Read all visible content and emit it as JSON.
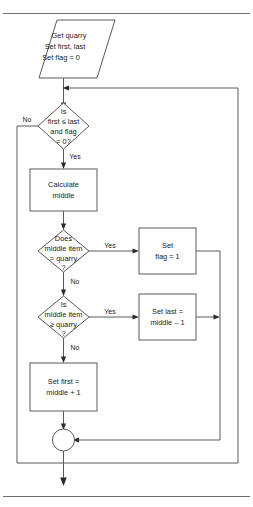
{
  "figure": {
    "border_color": "#6e6e6e",
    "shape_stroke": "#5a5a5a",
    "text_color": "#1a1a1a"
  },
  "nodes": [
    {
      "id": "start",
      "shape": "parallelogram",
      "lines": [
        "Get quarry",
        "Set first, last",
        "Set flag = 0"
      ]
    },
    {
      "id": "loop-test",
      "shape": "diamond",
      "lines": [
        "Is",
        "first ≤ last",
        "and flag",
        "= 0?"
      ]
    },
    {
      "id": "calc-middle",
      "shape": "rectangle",
      "lines": [
        "Calculate",
        "middle"
      ]
    },
    {
      "id": "equal-test",
      "shape": "diamond",
      "lines": [
        "Does",
        "middle item",
        "= quarry",
        "?"
      ]
    },
    {
      "id": "set-flag",
      "shape": "rectangle",
      "lines": [
        "Set",
        "flag = 1"
      ]
    },
    {
      "id": "ge-test",
      "shape": "diamond",
      "lines": [
        "Is",
        "middle item",
        "≥ quarry",
        "?"
      ]
    },
    {
      "id": "set-last",
      "shape": "rectangle",
      "lines": [
        "Set last =",
        "middle – 1"
      ]
    },
    {
      "id": "set-first",
      "shape": "rectangle",
      "lines": [
        "Set first =",
        "middle + 1"
      ]
    },
    {
      "id": "junction",
      "shape": "circle",
      "lines": []
    }
  ],
  "edge_labels": {
    "loop_test_no": "No",
    "loop_test_yes": "Yes",
    "equal_test_yes": "Yes",
    "equal_test_no": "No",
    "ge_test_yes": "Yes",
    "ge_test_no": "No"
  },
  "node_text": {
    "start": {
      "l1": "Get quarry",
      "l2": "Set first, last",
      "l3": "Set flag = 0"
    },
    "loop_test": {
      "l1": "Is",
      "l2": "first ≤ last",
      "l3": "and flag",
      "l4": "= 0?"
    },
    "calc_middle": {
      "l1": "Calculate",
      "l2": "middle"
    },
    "equal_test": {
      "l1": "Does",
      "l2": "middle item",
      "l3": "= quarry",
      "l4": "?"
    },
    "set_flag": {
      "l1": "Set",
      "l2": "flag = 1"
    },
    "ge_test": {
      "l1": "Is",
      "l2": "middle item",
      "l3": "≥ quarry",
      "l4": "?"
    },
    "set_last": {
      "l1": "Set last =",
      "l2": "middle – 1"
    },
    "set_first": {
      "l1": "Set first =",
      "l2": "middle + 1"
    }
  }
}
